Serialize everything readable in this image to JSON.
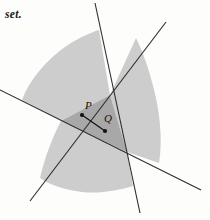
{
  "figure": {
    "caption_fragment": "set.",
    "background_color": "#fdfdfc",
    "region_fill_light": "#cdcdcd",
    "region_fill_dark": "#a8a8a8",
    "line_color": "#2b2b2b",
    "point_color": "#111111",
    "labels": {
      "point_p": "P",
      "point_q": "Q"
    },
    "points": {
      "p": {
        "x": 82,
        "y": 115
      },
      "q": {
        "x": 105,
        "y": 131
      }
    },
    "lines": [
      {
        "name": "line-shallow",
        "x1": 0,
        "y1": 90,
        "x2": 201,
        "y2": 190
      },
      {
        "name": "line-steep",
        "x1": 95,
        "y1": 3,
        "x2": 140,
        "y2": 213
      },
      {
        "name": "line-diagonal",
        "x1": 30,
        "y1": 201,
        "x2": 166,
        "y2": 22
      }
    ],
    "intersections": {
      "left": {
        "x": 61,
        "y": 121
      },
      "top": {
        "x": 110,
        "y": 95
      },
      "bottom": {
        "x": 127,
        "y": 152
      }
    },
    "segment_pq": {
      "x1": 82,
      "y1": 115,
      "x2": 105,
      "y2": 131
    }
  }
}
